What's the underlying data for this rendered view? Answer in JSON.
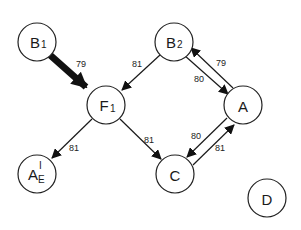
{
  "diagram": {
    "type": "directed-graph",
    "nodes": [
      {
        "id": "B1",
        "label": "B",
        "sub": "1",
        "sup": "",
        "x": 37,
        "y": 42
      },
      {
        "id": "B2",
        "label": "B",
        "sub": "2",
        "sup": "",
        "x": 174,
        "y": 42
      },
      {
        "id": "F1",
        "label": "F",
        "sub": "1",
        "sup": "",
        "x": 106,
        "y": 105
      },
      {
        "id": "A",
        "label": "A",
        "sub": "",
        "sup": "",
        "x": 243,
        "y": 105
      },
      {
        "id": "AE",
        "label": "A",
        "sub": "E",
        "sup": "I",
        "x": 37,
        "y": 174
      },
      {
        "id": "C",
        "label": "C",
        "sub": "",
        "sup": "",
        "x": 175,
        "y": 174
      },
      {
        "id": "D",
        "label": "D",
        "sub": "",
        "sup": "",
        "x": 267,
        "y": 198
      }
    ],
    "edges": [
      {
        "from": "B1",
        "to": "F1",
        "label": "79",
        "thick": true
      },
      {
        "from": "B2",
        "to": "F1",
        "label": "81",
        "thick": false
      },
      {
        "from": "B2",
        "to": "A",
        "label": "80",
        "thick": false
      },
      {
        "from": "A",
        "to": "B2",
        "label": "79",
        "thick": false
      },
      {
        "from": "F1",
        "to": "AE",
        "label": "81",
        "thick": false
      },
      {
        "from": "F1",
        "to": "C",
        "label": "81",
        "thick": false
      },
      {
        "from": "A",
        "to": "C",
        "label": "80",
        "thick": false
      },
      {
        "from": "C",
        "to": "A",
        "label": "81",
        "thick": false
      }
    ]
  }
}
